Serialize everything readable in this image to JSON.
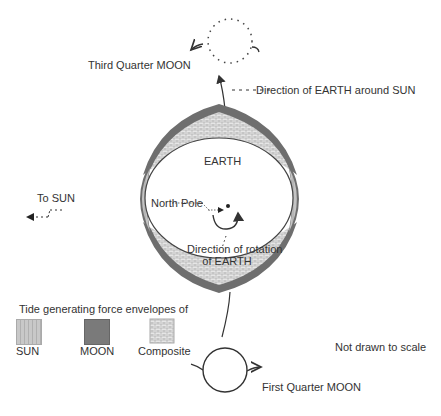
{
  "diagram": {
    "labels": {
      "third_quarter_moon": "Third Quarter MOON",
      "direction_earth_around_sun": "Direction of EARTH around SUN",
      "earth": "EARTH",
      "to_sun": "To SUN",
      "north_pole": "North Pole",
      "direction_rotation_line1": "Direction of rotation",
      "direction_rotation_line2": "of EARTH",
      "first_quarter_moon": "First Quarter MOON",
      "not_to_scale": "Not drawn to scale"
    },
    "legend": {
      "title": "Tide generating force envelopes of",
      "items": [
        {
          "label": "SUN",
          "color": "#bdbdbd"
        },
        {
          "label": "MOON",
          "color": "#7a7a7a"
        },
        {
          "label": "Composite",
          "color": "#e0e0e0"
        }
      ]
    },
    "colors": {
      "line": "#333333",
      "moon_envelope": "#6e6e6e",
      "sun_envelope": "#bdbdbd",
      "composite": "#d9d9d9"
    }
  }
}
